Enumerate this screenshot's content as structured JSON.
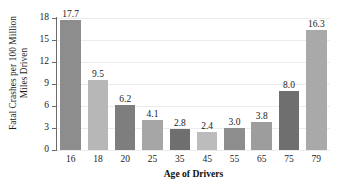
{
  "chart_data": {
    "type": "bar",
    "title": "",
    "xlabel": "Age of Drivers",
    "ylabel_lines": [
      "Fatal Crashes per 100 Million",
      "Miles Driven"
    ],
    "ylabel": "Fatal Crashes per 100 Million Miles Driven",
    "categories": [
      "16",
      "18",
      "20",
      "25",
      "35",
      "45",
      "55",
      "65",
      "75",
      "79"
    ],
    "values": [
      17.7,
      9.5,
      6.2,
      4.1,
      2.8,
      2.4,
      3.0,
      3.8,
      8.0,
      16.3
    ],
    "value_labels": [
      "17.7",
      "9.5",
      "6.2",
      "4.1",
      "2.8",
      "2.4",
      "3.0",
      "3.8",
      "8.0",
      "16.3"
    ],
    "ylim": [
      0,
      18
    ],
    "yticks": [
      0,
      3,
      6,
      9,
      12,
      15,
      18
    ],
    "ytick_labels": [
      "0",
      "3",
      "6",
      "9",
      "12",
      "15",
      "18"
    ],
    "grid": true,
    "legend": "none",
    "bar_colors": [
      "#8d8d8d",
      "#b7b7b7",
      "#7e7e7e",
      "#a6a6a6",
      "#6f6f6f",
      "#bcbcbc",
      "#8d8d8d",
      "#9d9d9d",
      "#6f6f6f",
      "#a9a9a9"
    ],
    "axis_color": "#6b6b6b",
    "grid_color": "#ececec",
    "background": "#ffffff"
  }
}
